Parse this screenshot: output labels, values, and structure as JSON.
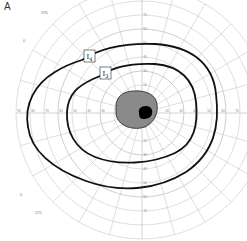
{
  "panel_label": "A",
  "chart": {
    "type": "goldmann-visual-field",
    "center": {
      "x": 142,
      "y": 113
    },
    "ring_step_px": 14,
    "ring_step_deg": 10,
    "rings_deg": [
      10,
      20,
      30,
      40,
      50,
      60,
      70,
      80,
      90
    ],
    "meridian_step_deg": 15,
    "grid_color": "#c8c8c8",
    "vertical_up_ticks": [
      "10",
      "20",
      "30",
      "40",
      "50",
      "60",
      "70"
    ],
    "vertical_down_ticks": [
      "10",
      "20",
      "30",
      "40",
      "50",
      "60",
      "70"
    ],
    "horizontal_right_ticks": [
      "10",
      "20",
      "30",
      "40",
      "50",
      "60",
      "70",
      "80",
      "90"
    ],
    "horizontal_left_ticks": [
      "10",
      "20",
      "30",
      "40",
      "50",
      "60",
      "70",
      "80",
      "90"
    ],
    "corner_labels": {
      "top_left_outer": "195",
      "top_left_inner": "0",
      "bottom_left_outer": "225",
      "bottom_left_inner": "0",
      "top_right": "45"
    },
    "isopters": [
      {
        "name": "I4",
        "label_main": "I",
        "label_sub": "4",
        "label_pos": {
          "x": 85,
          "y": 51
        }
      },
      {
        "name": "I3",
        "label_main": "I",
        "label_sub": "3",
        "label_pos": {
          "x": 102,
          "y": 68
        }
      }
    ],
    "scotoma": {
      "fill": "#8a8a8a",
      "blind_spot_fill": "#000000"
    }
  }
}
